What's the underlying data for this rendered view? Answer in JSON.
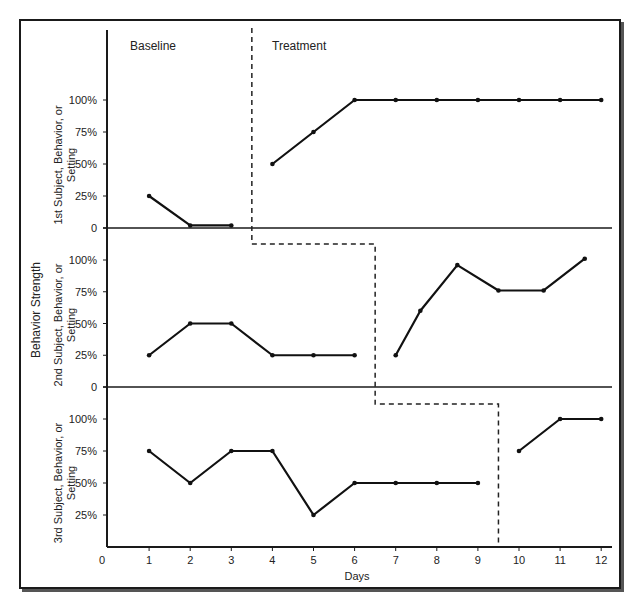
{
  "chart_data": {
    "type": "line",
    "title": "",
    "xlabel": "Days",
    "ylabel": "Behavior Strength",
    "x_ticks": [
      "0",
      "1",
      "2",
      "3",
      "4",
      "5",
      "6",
      "7",
      "8",
      "9",
      "10",
      "11",
      "12"
    ],
    "y_ticks": [
      "0",
      "25%",
      "50%",
      "75%",
      "100%"
    ],
    "phase_labels": [
      "Baseline",
      "Treatment"
    ],
    "panels": [
      {
        "label": "1st Subject, Behavior, or Setting",
        "phase_change_after_day": 3.5,
        "baseline": {
          "x": [
            1,
            2,
            3
          ],
          "y": [
            25,
            2,
            2
          ]
        },
        "treatment": {
          "x": [
            4,
            5,
            6,
            7,
            8,
            9,
            10,
            11,
            12
          ],
          "y": [
            50,
            75,
            100,
            100,
            100,
            100,
            100,
            100,
            100
          ]
        }
      },
      {
        "label": "2nd Subject, Behavior, or Setting",
        "phase_change_after_day": 6.5,
        "baseline": {
          "x": [
            1,
            2,
            3,
            4,
            5,
            6
          ],
          "y": [
            25,
            50,
            50,
            25,
            25,
            25
          ]
        },
        "treatment": {
          "x": [
            7,
            7.6,
            8.5,
            9.5,
            10.6,
            11.6
          ],
          "y": [
            25,
            60,
            96,
            76,
            76,
            101
          ]
        }
      },
      {
        "label": "3rd Subject, Behavior, or Setting",
        "phase_change_after_day": 9.5,
        "baseline": {
          "x": [
            1,
            2,
            3,
            4,
            5,
            6,
            7,
            8,
            9
          ],
          "y": [
            75,
            50,
            75,
            75,
            25,
            50,
            50,
            50,
            50
          ]
        },
        "treatment": {
          "x": [
            10,
            11,
            12
          ],
          "y": [
            75,
            100,
            100
          ]
        }
      }
    ],
    "ylim": [
      0,
      100
    ],
    "xlim": [
      0,
      12
    ],
    "grid": false,
    "legend": "none"
  },
  "labels": {
    "baseline": "Baseline",
    "treatment": "Treatment",
    "xlabel": "Days",
    "ylabel": "Behavior Strength",
    "panel1": [
      "1st Subject, Behavior, or",
      "Setting"
    ],
    "panel2": [
      "2nd Subject, Behavior, or",
      "Setting"
    ],
    "panel3": [
      "3rd Subject, Behavior, or",
      "Setting"
    ]
  }
}
